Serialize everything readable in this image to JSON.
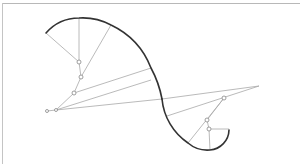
{
  "diagram": {
    "type": "geometric-construction",
    "colors": {
      "curve": "#333333",
      "radius_lines": "#a8a8a8",
      "center_points": "#888888",
      "border": "#b8b8b8",
      "background": "#ffffff"
    },
    "curve": {
      "upper_arcs": [
        {
          "from": [
            46,
            33
          ],
          "to": [
            79,
            18
          ],
          "center": [
            79,
            62
          ]
        },
        {
          "from": [
            79,
            18
          ],
          "to": [
            111,
            25
          ],
          "center": [
            81,
            77
          ]
        },
        {
          "from": [
            111,
            25
          ],
          "to": [
            151,
            68
          ],
          "center": [
            74,
            93
          ]
        },
        {
          "from": [
            151,
            68
          ],
          "to": [
            162,
            99
          ],
          "center": [
            56,
            110
          ]
        }
      ],
      "lower_arcs": [
        {
          "from": [
            162,
            99
          ],
          "to": [
            188,
            143
          ],
          "center": [
            224,
            98
          ]
        },
        {
          "from": [
            188,
            143
          ],
          "to": [
            210,
            150
          ],
          "center": [
            207,
            120
          ]
        },
        {
          "from": [
            210,
            150
          ],
          "to": [
            229,
            130
          ],
          "center": [
            209,
            129
          ]
        }
      ]
    },
    "radius_lines": [
      {
        "from": [
          46,
          33
        ],
        "to": [
          79,
          62
        ]
      },
      {
        "from": [
          79,
          18
        ],
        "to": [
          79,
          62
        ]
      },
      {
        "from": [
          79,
          62
        ],
        "to": [
          81,
          77
        ]
      },
      {
        "from": [
          111,
          25
        ],
        "to": [
          81,
          77
        ]
      },
      {
        "from": [
          81,
          77
        ],
        "to": [
          74,
          93
        ]
      },
      {
        "from": [
          74,
          93
        ],
        "to": [
          151,
          68
        ]
      },
      {
        "from": [
          74,
          93
        ],
        "to": [
          56,
          110
        ]
      },
      {
        "from": [
          56,
          110
        ],
        "to": [
          151,
          80
        ]
      },
      {
        "from": [
          56,
          110
        ],
        "to": [
          162,
          99
        ]
      },
      {
        "from": [
          47,
          111
        ],
        "to": [
          56,
          110
        ]
      },
      {
        "from": [
          162,
          99
        ],
        "to": [
          259,
          86
        ]
      },
      {
        "from": [
          167,
          116
        ],
        "to": [
          259,
          86
        ]
      },
      {
        "from": [
          224,
          98
        ],
        "to": [
          188,
          143
        ]
      },
      {
        "from": [
          224,
          98
        ],
        "to": [
          207,
          120
        ]
      },
      {
        "from": [
          207,
          120
        ],
        "to": [
          209,
          129
        ]
      },
      {
        "from": [
          209,
          129
        ],
        "to": [
          210,
          150
        ]
      },
      {
        "from": [
          209,
          129
        ],
        "to": [
          229,
          129
        ]
      }
    ],
    "center_points": [
      {
        "name": "center-1",
        "x": 79,
        "y": 62,
        "r": 2
      },
      {
        "name": "center-2",
        "x": 81,
        "y": 77,
        "r": 2
      },
      {
        "name": "center-3",
        "x": 74,
        "y": 93,
        "r": 2
      },
      {
        "name": "center-4",
        "x": 56,
        "y": 110,
        "r": 1.5
      },
      {
        "name": "center-5",
        "x": 47,
        "y": 111,
        "r": 1.5
      },
      {
        "name": "center-6",
        "x": 224,
        "y": 98,
        "r": 2
      },
      {
        "name": "center-7",
        "x": 207,
        "y": 120,
        "r": 2
      },
      {
        "name": "center-8",
        "x": 209,
        "y": 129,
        "r": 2
      }
    ]
  }
}
